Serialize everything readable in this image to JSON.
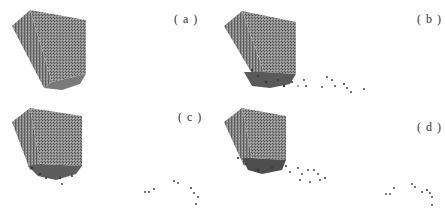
{
  "figure": {
    "panels": [
      {
        "id": "a",
        "label": "( a )"
      },
      {
        "id": "b",
        "label": "( b )"
      },
      {
        "id": "c",
        "label": "( c )"
      },
      {
        "id": "d",
        "label": "( d )"
      }
    ]
  }
}
